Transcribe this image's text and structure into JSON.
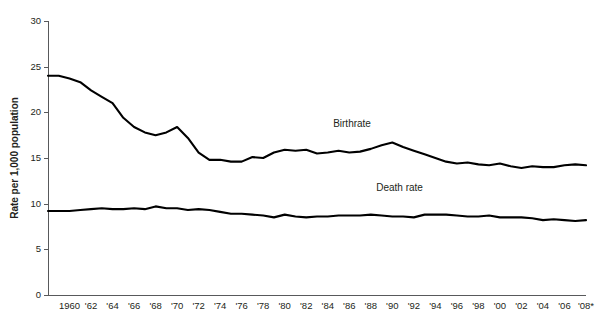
{
  "chart_data": {
    "type": "line",
    "title": "",
    "xlabel": "",
    "ylabel": "Rate per 1,000 population",
    "ylim": [
      0,
      30
    ],
    "yticks": [
      0,
      5,
      10,
      15,
      20,
      25,
      30
    ],
    "ytick_labels": [
      "0",
      "5",
      "10",
      "15",
      "20",
      "25",
      "30"
    ],
    "grid": false,
    "legend_position": "inline-annotation",
    "xlim": [
      1958,
      2008
    ],
    "x": [
      1958,
      1959,
      1960,
      1961,
      1962,
      1963,
      1964,
      1965,
      1966,
      1967,
      1968,
      1969,
      1970,
      1971,
      1972,
      1973,
      1974,
      1975,
      1976,
      1977,
      1978,
      1979,
      1980,
      1981,
      1982,
      1983,
      1984,
      1985,
      1986,
      1987,
      1988,
      1989,
      1990,
      1991,
      1992,
      1993,
      1994,
      1995,
      1996,
      1997,
      1998,
      1999,
      2000,
      2001,
      2002,
      2003,
      2004,
      2005,
      2006,
      2007,
      2008
    ],
    "xtick_values": [
      1960,
      1962,
      1964,
      1966,
      1968,
      1970,
      1972,
      1974,
      1976,
      1978,
      1980,
      1982,
      1984,
      1986,
      1988,
      1990,
      1992,
      1994,
      1996,
      1998,
      2000,
      2002,
      2004,
      2006,
      2008
    ],
    "xtick_labels": [
      "1960",
      "'62",
      "'64",
      "'66",
      "'68",
      "'70",
      "'72",
      "'74",
      "'76",
      "'78",
      "'80",
      "'82",
      "'84",
      "'86",
      "'88",
      "'90",
      "'92",
      "'94",
      "'96",
      "'98",
      "'00",
      "'02",
      "'04",
      "'06",
      "'08*"
    ],
    "series": [
      {
        "name": "Birthrate",
        "annotation": "Birthrate",
        "annotation_x": 1984.5,
        "annotation_y": 18.4,
        "values": [
          24.0,
          24.0,
          23.7,
          23.3,
          22.4,
          21.7,
          21.0,
          19.4,
          18.4,
          17.8,
          17.5,
          17.8,
          18.4,
          17.2,
          15.6,
          14.8,
          14.8,
          14.6,
          14.6,
          15.1,
          15.0,
          15.6,
          15.9,
          15.8,
          15.9,
          15.5,
          15.6,
          15.8,
          15.6,
          15.7,
          16.0,
          16.4,
          16.7,
          16.2,
          15.8,
          15.4,
          15.0,
          14.6,
          14.4,
          14.5,
          14.3,
          14.2,
          14.4,
          14.1,
          13.9,
          14.1,
          14.0,
          14.0,
          14.2,
          14.3,
          14.2
        ]
      },
      {
        "name": "Death rate",
        "annotation": "Death rate",
        "annotation_x": 1988.5,
        "annotation_y": 11.4,
        "values": [
          9.2,
          9.2,
          9.2,
          9.3,
          9.4,
          9.5,
          9.4,
          9.4,
          9.5,
          9.4,
          9.7,
          9.5,
          9.5,
          9.3,
          9.4,
          9.3,
          9.1,
          8.9,
          8.9,
          8.8,
          8.7,
          8.5,
          8.8,
          8.6,
          8.5,
          8.6,
          8.6,
          8.7,
          8.7,
          8.7,
          8.8,
          8.7,
          8.6,
          8.6,
          8.5,
          8.8,
          8.8,
          8.8,
          8.7,
          8.6,
          8.6,
          8.7,
          8.5,
          8.5,
          8.5,
          8.4,
          8.2,
          8.3,
          8.2,
          8.1,
          8.2
        ]
      }
    ]
  },
  "plot": {
    "left": 48,
    "right": 586,
    "top": 21,
    "bottom": 295
  }
}
